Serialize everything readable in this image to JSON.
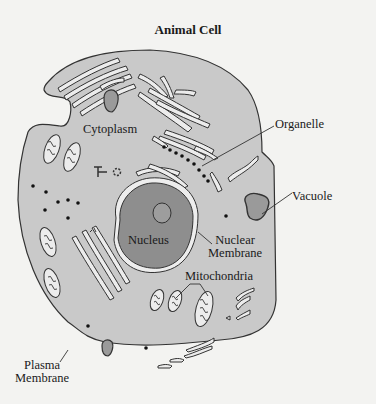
{
  "diagram": {
    "title": "Animal Cell",
    "colors": {
      "background": "#f3f3f1",
      "cytoplasm": "#c9c9c9",
      "nucleus": "#8e8e8e",
      "organelle_fill": "#9a9a9a",
      "outline": "#333333",
      "er_fill": "#ececec"
    },
    "labels": {
      "cytoplasm": "Cytoplasm",
      "organelle": "Organelle",
      "vacuole": "Vacuole",
      "nucleus": "Nucleus",
      "nuclear_membrane_1": "Nuclear",
      "nuclear_membrane_2": "Membrane",
      "mitochondria": "Mitochondria",
      "plasma_membrane_1": "Plasma",
      "plasma_membrane_2": "Membrane"
    }
  }
}
